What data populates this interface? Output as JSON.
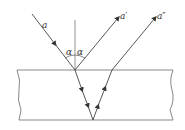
{
  "diagram": {
    "labels": {
      "incident": "a",
      "reflected": "a′",
      "emergent": "a″",
      "angle_left": "α",
      "angle_right": "α"
    },
    "colors": {
      "line": "#555555",
      "surface": "#888888"
    }
  }
}
